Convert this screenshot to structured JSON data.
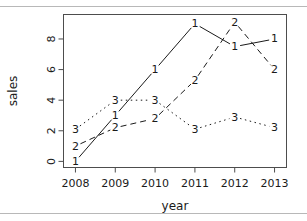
{
  "figure": {
    "top_clipped_text": "",
    "x_axis_title": "year",
    "y_axis_title": "sales"
  },
  "chart_data": {
    "type": "line",
    "title": "",
    "subtitle": "",
    "xlabel": "year",
    "ylabel": "sales",
    "x": [
      2008,
      2009,
      2010,
      2011,
      2012,
      2013
    ],
    "categories": [
      "2008",
      "2009",
      "2010",
      "2011",
      "2012",
      "2013"
    ],
    "xtick_labels": [
      "2008",
      "2009",
      "2010",
      "2011",
      "2012",
      "2013"
    ],
    "ytick_labels": [
      "0",
      "2",
      "4",
      "6",
      "8"
    ],
    "yticks": [
      0,
      2,
      4,
      6,
      8
    ],
    "xlim": [
      2007.7,
      2013.3
    ],
    "ylim": [
      -0.4,
      9.6
    ],
    "grid": false,
    "legend": "none",
    "point_marker_style": "numeric-character",
    "series": [
      {
        "name": "1",
        "label": "1",
        "linestyle": "solid",
        "values": [
          0,
          3,
          6,
          9,
          7.5,
          8
        ]
      },
      {
        "name": "2",
        "label": "2",
        "linestyle": "dashed",
        "values": [
          1,
          2.2,
          2.8,
          5.3,
          9.1,
          6
        ]
      },
      {
        "name": "3",
        "label": "3",
        "linestyle": "dotted",
        "values": [
          2.1,
          4.0,
          4.0,
          2.1,
          2.9,
          2.2
        ]
      }
    ]
  }
}
